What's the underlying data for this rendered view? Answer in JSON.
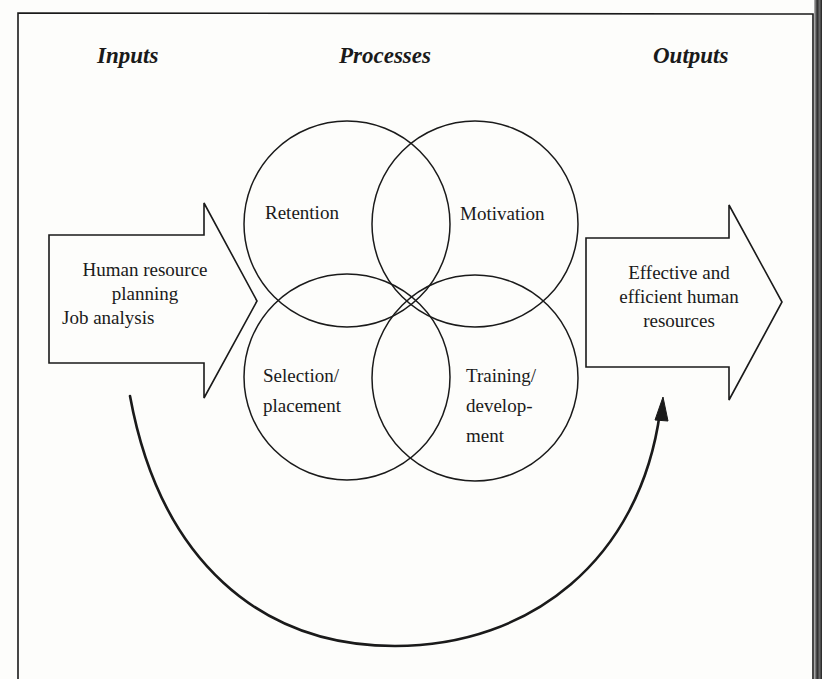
{
  "figure": {
    "headers": {
      "inputs": "Inputs",
      "processes": "Processes",
      "outputs": "Outputs"
    },
    "input_arrow": {
      "line1": "Human resource",
      "line2": "planning",
      "line3": "Job analysis"
    },
    "processes": {
      "retention": "Retention",
      "motivation": "Motivation",
      "selection_line1": "Selection/",
      "selection_line2": "placement",
      "training_line1": "Training/",
      "training_line2": "develop-",
      "training_line3": "ment"
    },
    "output_arrow": {
      "line1": "Effective and",
      "line2": "efficient human",
      "line3": "resources"
    },
    "feedback_arrow": "curved arrow from inputs to outputs",
    "colors": {
      "stroke": "#1a1a1a",
      "background": "#fdfdfb"
    }
  }
}
